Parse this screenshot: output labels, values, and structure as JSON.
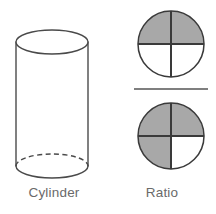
{
  "canvas": {
    "width": 216,
    "height": 214,
    "background": "#ffffff"
  },
  "palette": {
    "shaded_fill": "#a8a8a8",
    "unshaded_fill": "#ffffff",
    "outline": "#3a3a3a",
    "thin_outline": "#4a4a4a",
    "label_text": "#6a6a6a",
    "divider": "#555555"
  },
  "figures": [
    {
      "id": "cylinder",
      "label": "Cylinder",
      "shape": "cylinder",
      "description": "Outlined three-dimensional cylinder with elliptical top and dashed hidden bottom edge",
      "geometry": {
        "center_x": 52,
        "top_ellipse_cy": 42,
        "bottom_ellipse_cy": 166,
        "radius_x": 36,
        "radius_y": 12,
        "body_top": 42,
        "body_bottom": 166
      },
      "fill": "#ffffff",
      "stroke": "#4a4a4a",
      "stroke_width": 1.4,
      "hidden_edge_style": "dashed"
    },
    {
      "id": "ratio",
      "label": "Ratio",
      "shape": "fraction-of-circles",
      "description": "Two quartered circles stacked as a fraction with a horizontal bar between them",
      "divider": {
        "x1": 26,
        "x2": 100,
        "y": 89,
        "thickness": 1.6
      },
      "circles": [
        {
          "position": "numerator",
          "cx": 63,
          "cy": 44,
          "r": 33,
          "quadrants": [
            {
              "name": "top-left",
              "shaded": true
            },
            {
              "name": "top-right",
              "shaded": true
            },
            {
              "name": "bottom-left",
              "shaded": false
            },
            {
              "name": "bottom-right",
              "shaded": false
            }
          ],
          "shaded_count": 2,
          "total_count": 4,
          "fraction_text": "2/4"
        },
        {
          "position": "denominator",
          "cx": 63,
          "cy": 136,
          "r": 33,
          "quadrants": [
            {
              "name": "top-left",
              "shaded": true
            },
            {
              "name": "top-right",
              "shaded": true
            },
            {
              "name": "bottom-left",
              "shaded": true
            },
            {
              "name": "bottom-right",
              "shaded": false
            }
          ],
          "shaded_count": 3,
          "total_count": 4,
          "fraction_text": "3/4"
        }
      ]
    }
  ]
}
